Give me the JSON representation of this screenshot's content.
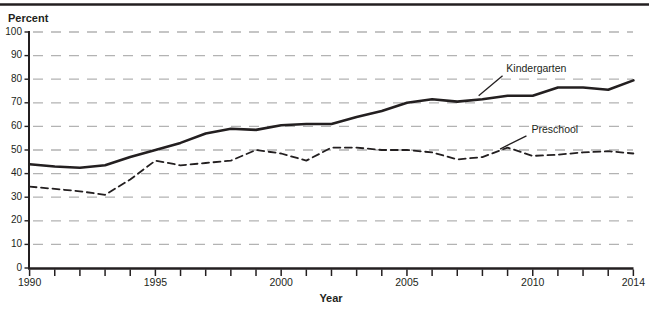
{
  "page": {
    "background": "#ffffff",
    "top_rule_color": "#231f20"
  },
  "chart_data": {
    "type": "line",
    "title": "",
    "ylabel": "Percent",
    "xlabel": "Year",
    "ylim": [
      0,
      100
    ],
    "ytick_step": 10,
    "yticks": [
      0,
      10,
      20,
      30,
      40,
      50,
      60,
      70,
      80,
      90,
      100
    ],
    "x": [
      1990,
      1991,
      1992,
      1993,
      1994,
      1995,
      1996,
      1997,
      1998,
      1999,
      2000,
      2001,
      2002,
      2003,
      2004,
      2005,
      2006,
      2007,
      2008,
      2009,
      2010,
      2011,
      2012,
      2013,
      2014
    ],
    "xticks_labeled": [
      1990,
      1995,
      2000,
      2005,
      2010,
      2014
    ],
    "grid": "horizontal-dashed",
    "gridline_color": "#b3b3b3",
    "axis_color": "#231f20",
    "legend_position": "inline-annotations",
    "series": [
      {
        "name": "Kindergarten",
        "style": "solid",
        "color": "#231f20",
        "values": [
          44,
          43,
          42.5,
          43.5,
          47,
          50,
          53,
          57,
          59,
          58.5,
          60.5,
          61,
          61,
          64,
          66.5,
          70,
          71.5,
          70.5,
          71.5,
          73,
          73,
          76.5,
          76.5,
          75.5,
          79.5
        ]
      },
      {
        "name": "Preschool",
        "style": "dashed",
        "color": "#231f20",
        "values": [
          34.5,
          33.5,
          32.5,
          31,
          37.5,
          45.5,
          43.5,
          44.5,
          45.5,
          50,
          48.5,
          45.5,
          51,
          51,
          50,
          50,
          49,
          46,
          47,
          51,
          47.5,
          48,
          49,
          49.5,
          48.5
        ]
      }
    ],
    "annotations": [
      {
        "text": "Kindergarten",
        "series": "Kindergarten",
        "label_year": 2008.95,
        "label_value": 83.0,
        "pointer_from_year": 2008.8,
        "pointer_from_value": 81.5,
        "pointer_to_year": 2007.85,
        "pointer_to_value": 73.0
      },
      {
        "text": "Preschool",
        "series": "Preschool",
        "label_year": 2009.95,
        "label_value": 57.2,
        "pointer_from_year": 2009.75,
        "pointer_from_value": 56.0,
        "pointer_to_year": 2008.7,
        "pointer_to_value": 50.4
      }
    ]
  }
}
